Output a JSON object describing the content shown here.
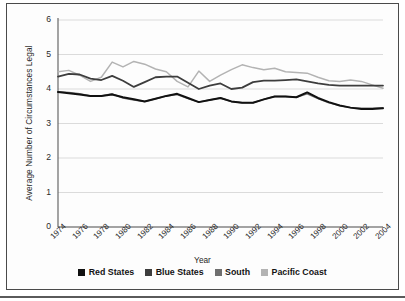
{
  "chart_data": {
    "type": "line",
    "title": "",
    "xlabel": "Year",
    "ylabel": "Average Number of Circumstances Legal",
    "ylim": [
      0,
      6
    ],
    "yticks": [
      0,
      1,
      2,
      3,
      4,
      5,
      6
    ],
    "grid": "horizontal",
    "legend_position": "bottom",
    "x": [
      1974,
      1975,
      1976,
      1977,
      1978,
      1979,
      1980,
      1981,
      1982,
      1983,
      1984,
      1985,
      1986,
      1987,
      1988,
      1989,
      1990,
      1991,
      1992,
      1993,
      1994,
      1995,
      1996,
      1997,
      1998,
      1999,
      2000,
      2001,
      2002,
      2003,
      2004
    ],
    "xtick_labels": [
      "1974",
      "1976",
      "1978",
      "1980",
      "1982",
      "1984",
      "1986",
      "1988",
      "1990",
      "1992",
      "1994",
      "1996",
      "1998",
      "2000",
      "2002",
      "2004"
    ],
    "series": [
      {
        "name": "Red States",
        "color": "#111111",
        "values": [
          3.91,
          3.88,
          3.84,
          3.8,
          3.8,
          3.84,
          3.76,
          3.7,
          3.64,
          3.72,
          3.8,
          3.86,
          3.74,
          3.62,
          3.68,
          3.74,
          3.64,
          3.6,
          3.6,
          3.7,
          3.78,
          3.78,
          3.76,
          3.9,
          3.74,
          3.62,
          3.52,
          3.46,
          3.42,
          3.42,
          3.44
        ]
      },
      {
        "name": "Blue States",
        "color": "#3d3d3d",
        "values": [
          4.36,
          4.44,
          4.42,
          4.3,
          4.26,
          4.38,
          4.24,
          4.06,
          4.2,
          4.34,
          4.36,
          4.36,
          4.18,
          4.0,
          4.1,
          4.16,
          4.0,
          4.04,
          4.2,
          4.24,
          4.24,
          4.26,
          4.28,
          4.22,
          4.16,
          4.12,
          4.1,
          4.1,
          4.1,
          4.1,
          4.1
        ]
      },
      {
        "name": "South",
        "color": "#6f6f6f",
        "values": [
          3.92,
          3.9,
          3.86,
          3.8,
          3.8,
          3.86,
          3.74,
          3.68,
          3.64,
          3.72,
          3.8,
          3.84,
          3.72,
          3.62,
          3.68,
          3.74,
          3.64,
          3.6,
          3.6,
          3.7,
          3.78,
          3.78,
          3.76,
          3.86,
          3.72,
          3.6,
          3.52,
          3.46,
          3.44,
          3.44,
          3.46
        ]
      },
      {
        "name": "Pacific Coast",
        "color": "#b3b3b3",
        "values": [
          4.5,
          4.54,
          4.4,
          4.22,
          4.34,
          4.78,
          4.64,
          4.8,
          4.72,
          4.58,
          4.5,
          4.22,
          4.06,
          4.52,
          4.22,
          4.4,
          4.56,
          4.7,
          4.62,
          4.56,
          4.6,
          4.5,
          4.48,
          4.46,
          4.34,
          4.24,
          4.22,
          4.26,
          4.22,
          4.12,
          4.02
        ]
      }
    ]
  },
  "axes": {
    "y_title": "Average Number of Circumstances Legal",
    "x_title": "Year"
  },
  "legend": {
    "items": [
      {
        "label": "Red States",
        "color": "#111111"
      },
      {
        "label": "Blue States",
        "color": "#3d3d3d"
      },
      {
        "label": "South",
        "color": "#6f6f6f"
      },
      {
        "label": "Pacific Coast",
        "color": "#b3b3b3"
      }
    ]
  }
}
